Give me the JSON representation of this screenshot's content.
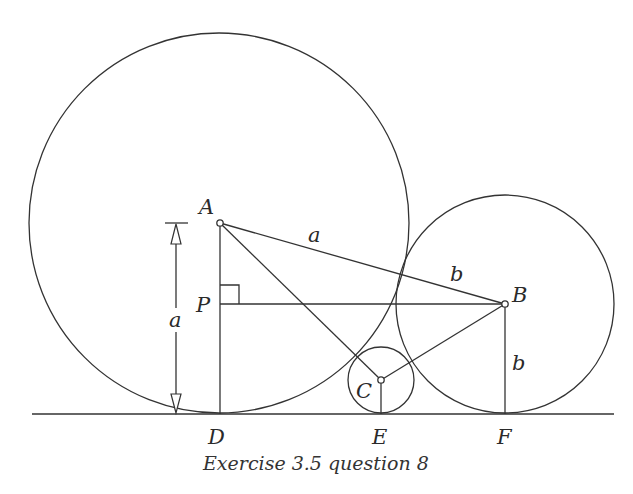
{
  "figure": {
    "caption": "Exercise 3.5 question 8",
    "points": {
      "A": "A",
      "B": "B",
      "C": "C",
      "D": "D",
      "E": "E",
      "F": "F",
      "P": "P"
    },
    "segment_labels": {
      "AB_part_a": "a",
      "AB_part_b": "b",
      "BF": "b",
      "dimension_AD": "a"
    },
    "circles": [
      {
        "name": "circle-A",
        "center": "A",
        "radius_label": "a"
      },
      {
        "name": "circle-B",
        "center": "B",
        "radius_label": "b"
      },
      {
        "name": "circle-C",
        "center": "C",
        "radius_label": ""
      }
    ],
    "features": {
      "right_angle_at": "P",
      "common_tangent_line": "DEF"
    },
    "colors": {
      "ink": "#333333",
      "background": "#ffffff"
    }
  }
}
